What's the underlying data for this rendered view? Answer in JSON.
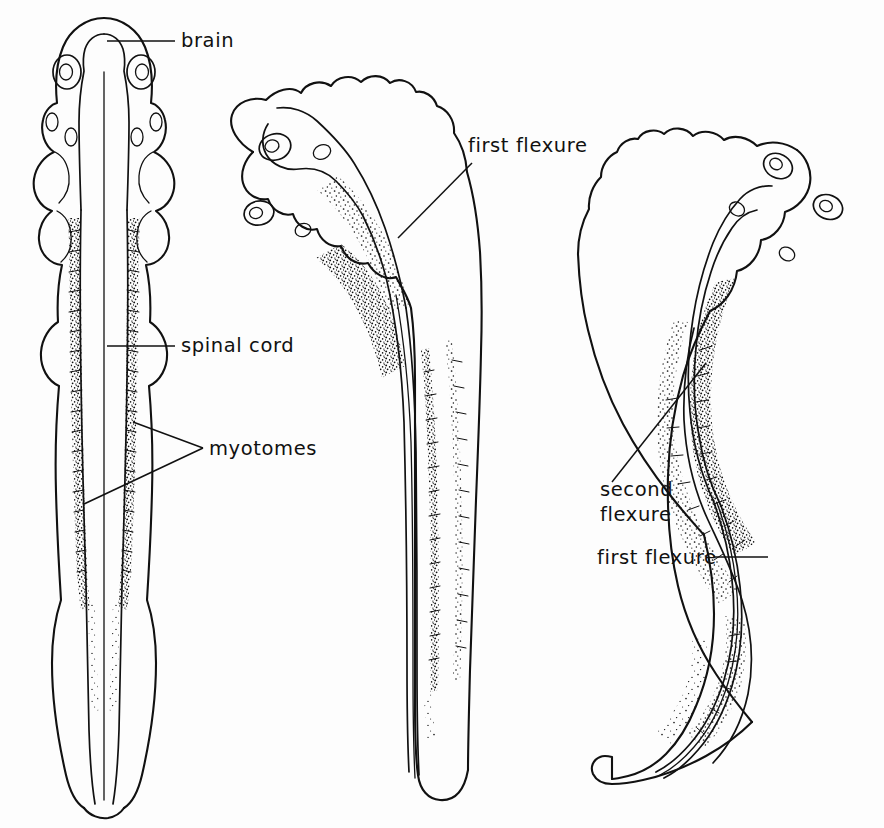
{
  "figure": {
    "background_color": "#fdfdfd",
    "ink_color": "#111111",
    "views": [
      {
        "id": "dorsal-view",
        "name": "dorsal view",
        "position": "left",
        "description": "Dorsal view of embryo showing bilaterally symmetrical brain, spinal cord and paired myotomes"
      },
      {
        "id": "first-flexure-view",
        "name": "lateral view with first flexure",
        "position": "center",
        "description": "Lateral view of embryo with a single cranial flexure"
      },
      {
        "id": "second-flexure-view",
        "name": "lateral view with second flexure",
        "position": "right",
        "description": "Lateral view of older embryo with two flexures forming an S-curve"
      }
    ]
  },
  "labels": [
    {
      "id": "brain",
      "text": "brain",
      "view": "dorsal-view",
      "x": 181,
      "y": 47
    },
    {
      "id": "spinal-cord",
      "text": "spinal cord",
      "view": "dorsal-view",
      "x": 181,
      "y": 352
    },
    {
      "id": "myotomes",
      "text": "myotomes",
      "view": "dorsal-view",
      "x": 209,
      "y": 455
    },
    {
      "id": "first-flexure-center",
      "text": "first flexure",
      "view": "first-flexure-view",
      "x": 468,
      "y": 152
    },
    {
      "id": "second-flexure",
      "text": "second\nflexure",
      "view": "second-flexure-view",
      "x": 600,
      "y": 496
    },
    {
      "id": "first-flexure-right",
      "text": "first flexure",
      "view": "second-flexure-view",
      "x": 597,
      "y": 558
    }
  ],
  "label_lines": {
    "second_flexure_line1": "second",
    "second_flexure_line2": "flexure"
  },
  "leaders": [
    {
      "id": "brain-leader",
      "type": "horizontal",
      "x1": 107,
      "y1": 41,
      "x2": 175,
      "y2": 41
    },
    {
      "id": "spinal-cord-leader",
      "type": "horizontal",
      "x1": 107,
      "y1": 346,
      "x2": 175,
      "y2": 346
    },
    {
      "id": "myotomes-leader-upper",
      "type": "diagonal",
      "x1": 133,
      "y1": 422,
      "x2": 203,
      "y2": 448
    },
    {
      "id": "myotomes-leader-lower",
      "type": "diagonal",
      "x1": 84,
      "y1": 504,
      "x2": 203,
      "y2": 448
    },
    {
      "id": "first-flexure-center-leader",
      "type": "diagonal",
      "x1": 398,
      "y1": 238,
      "x2": 472,
      "y2": 163
    },
    {
      "id": "second-flexure-leader",
      "type": "diagonal",
      "x1": 612,
      "y1": 482,
      "x2": 706,
      "y2": 363
    },
    {
      "id": "first-flexure-right-leader",
      "type": "horizontal",
      "x1": 714,
      "y1": 557,
      "x2": 768,
      "y2": 557
    }
  ],
  "anatomy": {
    "structures": [
      "brain",
      "spinal cord",
      "myotomes",
      "eye vesicle",
      "otic vesicle",
      "gill arches",
      "notochord",
      "tail fin",
      "first flexure",
      "second flexure"
    ]
  }
}
